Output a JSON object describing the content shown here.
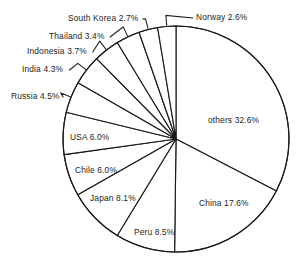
{
  "chart_data": {
    "type": "pie",
    "title": "",
    "subtitle": "",
    "xlabel": "",
    "ylabel": "",
    "legend_position": "none",
    "grid": false,
    "start_angle_deg": 0,
    "direction": "clockwise",
    "units": "percent",
    "categories": [
      "others",
      "China",
      "Peru",
      "Japan",
      "Chile",
      "USA",
      "Russia",
      "India",
      "Indonesia",
      "Thailand",
      "South Korea",
      "Norway"
    ],
    "values": [
      32.6,
      17.6,
      8.5,
      8.1,
      6.0,
      6.0,
      4.5,
      4.3,
      3.7,
      3.4,
      2.7,
      2.6
    ],
    "slices": [
      {
        "name": "others",
        "value": 32.6,
        "label": "others 32.6%",
        "label_placement": "inside",
        "label_x": 208,
        "label_y": 116
      },
      {
        "name": "China",
        "value": 17.6,
        "label": "China 17.6%",
        "label_placement": "inside",
        "label_x": 199,
        "label_y": 199
      },
      {
        "name": "Peru",
        "value": 8.5,
        "label": "Peru 8.5%",
        "label_placement": "inside",
        "label_x": 134,
        "label_y": 228
      },
      {
        "name": "Japan",
        "value": 8.1,
        "label": "Japan 8.1%",
        "label_placement": "inside",
        "label_x": 90,
        "label_y": 194
      },
      {
        "name": "Chile",
        "value": 6.0,
        "label": "Chile 6.0%",
        "label_placement": "inside",
        "label_x": 75,
        "label_y": 166
      },
      {
        "name": "USA",
        "value": 6.0,
        "label": "USA 6.0%",
        "label_placement": "inside",
        "label_x": 70,
        "label_y": 133
      },
      {
        "name": "Russia",
        "value": 4.5,
        "label": "Russia 4.5%",
        "label_placement": "outside",
        "label_x": 11,
        "label_y": 92
      },
      {
        "name": "India",
        "value": 4.3,
        "label": "India 4.3%",
        "label_placement": "outside",
        "label_x": 22,
        "label_y": 65
      },
      {
        "name": "Indonesia",
        "value": 3.7,
        "label": "Indonesia 3.7%",
        "label_placement": "outside",
        "label_x": 27,
        "label_y": 47
      },
      {
        "name": "Thailand",
        "value": 3.4,
        "label": "Thailand 3.4%",
        "label_placement": "outside",
        "label_x": 49,
        "label_y": 32
      },
      {
        "name": "South Korea",
        "value": 2.7,
        "label": "South Korea 2.7%",
        "label_placement": "outside",
        "label_x": 68,
        "label_y": 14
      },
      {
        "name": "Norway",
        "value": 2.6,
        "label": "Norway 2.6%",
        "label_placement": "outside",
        "label_x": 196,
        "label_y": 13
      }
    ],
    "colors": {
      "slice_fill": "#ffffff",
      "slice_outline": "#1a1a1a",
      "label_text": "#1d1d1d",
      "background": "#ffffff"
    },
    "geometry": {
      "center_x": 176,
      "center_y": 139,
      "radius": 113
    }
  }
}
